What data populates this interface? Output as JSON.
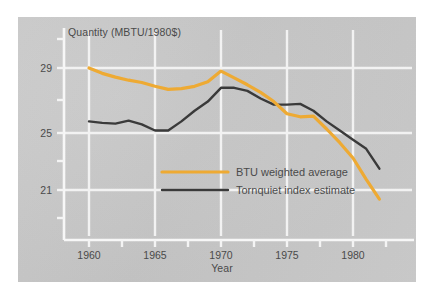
{
  "figure": {
    "background_color": "#ffffff",
    "plate_color": "#c9c9c9",
    "gridline_color": "#f2f2f2",
    "text_color": "#4a4a4a"
  },
  "chart_data": {
    "type": "line",
    "title": "",
    "ylabel": "Quantity (MBTU/1980$)",
    "xlabel": "Year",
    "xlim": [
      1958.2,
      1983.0
    ],
    "ylim": [
      17.8,
      31.2
    ],
    "xticks": [
      1960,
      1965,
      1970,
      1975,
      1980
    ],
    "xtick_labels": [
      "1960",
      "1965",
      "1970",
      "1975",
      "1980"
    ],
    "yticks": [
      21,
      25,
      29
    ],
    "ytick_labels": [
      "21",
      "25",
      "29"
    ],
    "y_minor_ticks": [
      19,
      23,
      27,
      31
    ],
    "grid": true,
    "legend_position": "center-right",
    "x": [
      1960,
      1961,
      1962,
      1963,
      1964,
      1965,
      1966,
      1967,
      1968,
      1969,
      1970,
      1971,
      1972,
      1973,
      1974,
      1975,
      1976,
      1977,
      1978,
      1979,
      1980,
      1981,
      1982
    ],
    "series": [
      {
        "name": "BTU weighted average",
        "color": "#eeaa33",
        "values": [
          29.0,
          28.65,
          28.4,
          28.2,
          28.05,
          27.8,
          27.6,
          27.65,
          27.8,
          28.1,
          28.8,
          28.35,
          27.9,
          27.4,
          26.8,
          26.0,
          25.8,
          25.85,
          25.0,
          24.1,
          23.1,
          21.7,
          20.4
        ]
      },
      {
        "name": "Tornquiet index estimate",
        "color": "#3a3a3a",
        "values": [
          25.5,
          25.4,
          25.35,
          25.55,
          25.3,
          24.9,
          24.9,
          25.5,
          26.2,
          26.8,
          27.7,
          27.7,
          27.5,
          27.0,
          26.6,
          26.6,
          26.65,
          26.2,
          25.5,
          24.9,
          24.3,
          23.7,
          22.4
        ]
      }
    ]
  },
  "legend": {
    "entries": [
      {
        "label": "BTU weighted average",
        "color": "#eeaa33"
      },
      {
        "label": "Tornquiet index estimate",
        "color": "#3a3a3a"
      }
    ]
  }
}
